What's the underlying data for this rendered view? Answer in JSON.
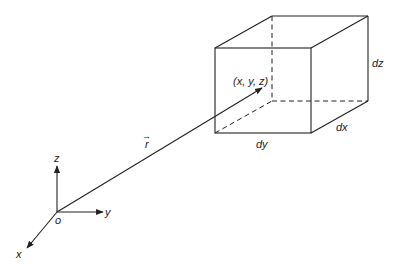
{
  "figure": {
    "labels": {
      "point": "(x, y, z)",
      "dz": "dz",
      "dx": "dx",
      "dy": "dy",
      "r_vector": "r",
      "r_arrow": "→",
      "origin": "o",
      "axis_x": "x",
      "axis_y": "y",
      "axis_z": "z"
    },
    "colors": {
      "line": "#222222",
      "background": "#ffffff"
    },
    "cube": {
      "front_top_left": [
        215,
        48
      ],
      "front_top_right": [
        311,
        48
      ],
      "front_bottom_left": [
        215,
        133
      ],
      "front_bottom_right": [
        311,
        133
      ],
      "back_top_left": [
        272,
        16
      ],
      "back_top_right": [
        368,
        16
      ],
      "back_bottom_left": [
        272,
        101
      ],
      "back_bottom_right": [
        368,
        101
      ]
    },
    "origin": [
      57,
      212
    ],
    "position_vector_tip": [
      262,
      88
    ]
  }
}
